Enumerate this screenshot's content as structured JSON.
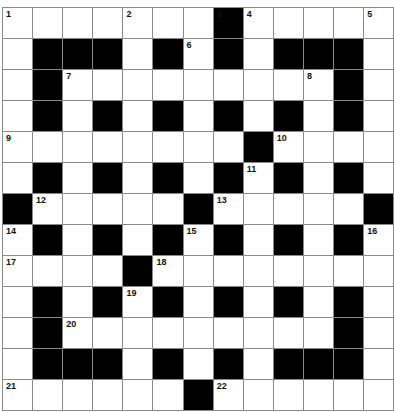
{
  "puzzle": {
    "rows": 13,
    "cols": 13,
    "colors": {
      "black": "#000000",
      "white": "#ffffff",
      "grid_line": "#8a8a8a",
      "number": "#111111"
    },
    "layout": [
      ".......#.....",
      ".###.#.#.###.",
      ".#.........#.",
      ".#.#.#.#.#.#.",
      "........#....",
      ".#.#.#.#.#.#.",
      "#.....#.....#",
      ".#.#.#.#.#.#.",
      "....#........",
      ".#.#.#.#.#.#.",
      ".#.........#.",
      ".###.#.#.###.",
      "......#......"
    ],
    "numbers": [
      {
        "n": "1",
        "r": 0,
        "c": 0
      },
      {
        "n": "2",
        "r": 0,
        "c": 4
      },
      {
        "n": "3",
        "r": 0,
        "c": 7
      },
      {
        "n": "4",
        "r": 0,
        "c": 8
      },
      {
        "n": "5",
        "r": 0,
        "c": 12
      },
      {
        "n": "6",
        "r": 1,
        "c": 6
      },
      {
        "n": "7",
        "r": 2,
        "c": 2
      },
      {
        "n": "8",
        "r": 2,
        "c": 10
      },
      {
        "n": "9",
        "r": 4,
        "c": 0
      },
      {
        "n": "10",
        "r": 4,
        "c": 9
      },
      {
        "n": "11",
        "r": 5,
        "c": 8
      },
      {
        "n": "12",
        "r": 6,
        "c": 1
      },
      {
        "n": "13",
        "r": 6,
        "c": 7
      },
      {
        "n": "14",
        "r": 7,
        "c": 0
      },
      {
        "n": "15",
        "r": 7,
        "c": 6
      },
      {
        "n": "16",
        "r": 7,
        "c": 12
      },
      {
        "n": "17",
        "r": 8,
        "c": 0
      },
      {
        "n": "18",
        "r": 8,
        "c": 5
      },
      {
        "n": "19",
        "r": 9,
        "c": 4
      },
      {
        "n": "20",
        "r": 10,
        "c": 2
      },
      {
        "n": "21",
        "r": 12,
        "c": 0
      },
      {
        "n": "22",
        "r": 12,
        "c": 7
      }
    ]
  }
}
